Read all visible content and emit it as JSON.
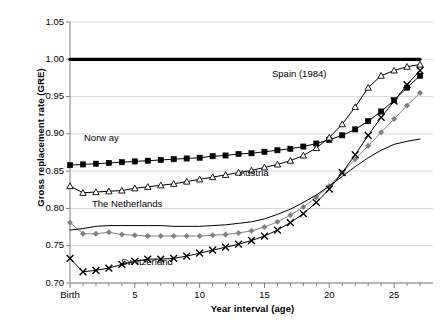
{
  "chart_data": {
    "type": "line",
    "title": "",
    "xlabel": "Year interval (age)",
    "ylabel": "Gross replacement rate (GRE)",
    "xlim": [
      0,
      28
    ],
    "ylim": [
      0.7,
      1.05
    ],
    "ytick_values": [
      0.7,
      0.75,
      0.8,
      0.85,
      0.9,
      0.95,
      1.0,
      1.05
    ],
    "ytick_labels": [
      "0.70",
      "0.75",
      "0.80",
      "0.85",
      "0.90",
      "0.95",
      "1.00",
      "1.05"
    ],
    "xtick_values": [
      0,
      5,
      10,
      15,
      20,
      25
    ],
    "xtick_labels": [
      "Birth",
      "5",
      "10",
      "15",
      "20",
      "25"
    ],
    "minor_xticks_every": 1,
    "grid": "horizontal",
    "legend_position": "inline-labels",
    "x": [
      0,
      1,
      2,
      3,
      4,
      5,
      6,
      7,
      8,
      9,
      10,
      11,
      12,
      13,
      14,
      15,
      16,
      17,
      18,
      19,
      20,
      21,
      22,
      23,
      24,
      25,
      26,
      27
    ],
    "series": [
      {
        "name": "Reference",
        "label": "",
        "marker": "none",
        "color": "#000000",
        "width": 3.2,
        "values": [
          1.0,
          1.0,
          1.0,
          1.0,
          1.0,
          1.0,
          1.0,
          1.0,
          1.0,
          1.0,
          1.0,
          1.0,
          1.0,
          1.0,
          1.0,
          1.0,
          1.0,
          1.0,
          1.0,
          1.0,
          1.0,
          1.0,
          1.0,
          1.0,
          1.0,
          1.0,
          1.0,
          1.0
        ]
      },
      {
        "name": "Norway",
        "label": "Norw ay",
        "marker": "square-filled",
        "color": "#000000",
        "width": 1,
        "values": [
          0.858,
          0.859,
          0.86,
          0.861,
          0.862,
          0.863,
          0.864,
          0.865,
          0.866,
          0.867,
          0.868,
          0.87,
          0.871,
          0.873,
          0.874,
          0.876,
          0.878,
          0.88,
          0.883,
          0.887,
          0.892,
          0.898,
          0.906,
          0.917,
          0.93,
          0.945,
          0.962,
          0.978
        ]
      },
      {
        "name": "Spain (1984)",
        "label": "Spain (1984)",
        "marker": "triangle-open",
        "color": "#000000",
        "width": 1,
        "values": [
          0.83,
          0.821,
          0.822,
          0.823,
          0.824,
          0.827,
          0.829,
          0.831,
          0.833,
          0.836,
          0.839,
          0.842,
          0.845,
          0.848,
          0.851,
          0.855,
          0.859,
          0.864,
          0.871,
          0.881,
          0.895,
          0.913,
          0.936,
          0.962,
          0.978,
          0.985,
          0.99,
          0.993
        ]
      },
      {
        "name": "Austria",
        "label": "Austria",
        "marker": "diamond-filled",
        "color": "#808080",
        "width": 1,
        "values": [
          0.781,
          0.766,
          0.766,
          0.768,
          0.765,
          0.764,
          0.763,
          0.763,
          0.763,
          0.763,
          0.763,
          0.764,
          0.765,
          0.767,
          0.77,
          0.775,
          0.782,
          0.791,
          0.802,
          0.815,
          0.83,
          0.848,
          0.866,
          0.884,
          0.902,
          0.92,
          0.938,
          0.955
        ]
      },
      {
        "name": "The Netherlands",
        "label": "The Netherlands",
        "marker": "none",
        "color": "#000000",
        "width": 1,
        "values": [
          0.771,
          0.773,
          0.776,
          0.777,
          0.777,
          0.777,
          0.777,
          0.777,
          0.776,
          0.776,
          0.776,
          0.777,
          0.778,
          0.78,
          0.782,
          0.786,
          0.792,
          0.799,
          0.808,
          0.818,
          0.83,
          0.843,
          0.856,
          0.868,
          0.878,
          0.886,
          0.89,
          0.893
        ]
      },
      {
        "name": "Switzerland",
        "label": "Sw itzerland",
        "marker": "x-cross",
        "color": "#000000",
        "width": 1,
        "values": [
          0.733,
          0.715,
          0.717,
          0.72,
          0.725,
          0.729,
          0.732,
          0.732,
          0.733,
          0.736,
          0.74,
          0.744,
          0.748,
          0.752,
          0.757,
          0.763,
          0.771,
          0.781,
          0.793,
          0.808,
          0.826,
          0.848,
          0.872,
          0.898,
          0.922,
          0.944,
          0.966,
          0.985
        ]
      }
    ],
    "annotations": [
      {
        "text": "Norw ay",
        "x_px": 84,
        "y_px": 132
      },
      {
        "text": "Spain (1984)",
        "x_px": 272,
        "y_px": 68
      },
      {
        "text": "Austria",
        "x_px": 239,
        "y_px": 167
      },
      {
        "text": "The Netherlands",
        "x_px": 92,
        "y_px": 198
      },
      {
        "text": "Sw itzerland",
        "x_px": 121,
        "y_px": 256
      }
    ],
    "colors": {
      "axis": "#000000",
      "grid": "#d9d9d9",
      "gray_series": "#808080",
      "background": "#ffffff"
    }
  }
}
